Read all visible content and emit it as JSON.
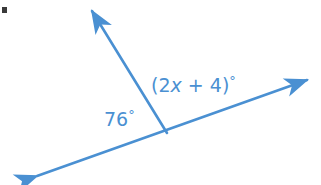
{
  "figure": {
    "type": "geometry-diagram",
    "background_color": "#ffffff",
    "stroke_color": "#4a90d2",
    "text_color": "#4a90d2",
    "bullet_color": "#3a3a3a",
    "vertex": {
      "x": 167,
      "y": 133
    },
    "rays": [
      {
        "name": "upper-ray",
        "from": {
          "x": 167,
          "y": 133
        },
        "to": {
          "x": 88,
          "y": 5
        },
        "arrowhead": "end"
      },
      {
        "name": "transversal-line",
        "from": {
          "x": 32,
          "y": 178
        },
        "to": {
          "x": 312,
          "y": 78
        },
        "arrowhead": "both"
      }
    ],
    "labels": {
      "left_angle": "76",
      "left_angle_degree_symbol": "°",
      "right_angle_open_paren": "(",
      "right_angle_coefficient": "2",
      "right_angle_variable": "x",
      "right_angle_operator": "+",
      "right_angle_constant": "4",
      "right_angle_close_paren": ")",
      "right_angle_degree_symbol": "°",
      "right_angle_full": "(2x + 4)°",
      "left_angle_full": "76°"
    }
  }
}
